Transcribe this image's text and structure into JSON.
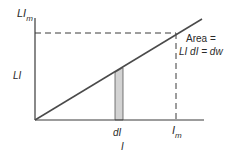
{
  "diagram": {
    "y_axis_label": "LI",
    "y_max_label_main": "LI",
    "y_max_label_sub": "m",
    "x_axis_label": "I",
    "x_max_label_main": "I",
    "x_max_label_sub": "m",
    "strip_label": "dI",
    "annotation_line1": "Area =",
    "annotation_line2": "LI dI = dw",
    "colors": {
      "line": "#4a4a4a",
      "axis": "#3a3a3a",
      "strip_fill": "#d3d3d3",
      "dash": "#3a3a3a"
    }
  }
}
